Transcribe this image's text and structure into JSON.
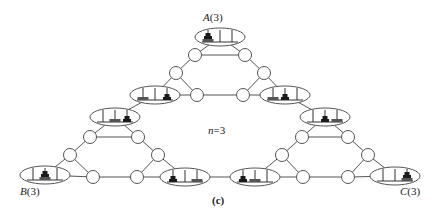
{
  "figure": {
    "caption": "(c)",
    "n_label_var": "n",
    "n_label_rest": "=3",
    "labels": {
      "A": {
        "letter": "A",
        "arg": "(3)"
      },
      "B": {
        "letter": "B",
        "arg": "(3)"
      },
      "C": {
        "letter": "C",
        "arg": "(3)"
      }
    }
  },
  "graph": {
    "stroke": "#555555",
    "disk_dark": "#1a1a1a",
    "disk_gray": "#555555",
    "circles": [
      {
        "x": 195,
        "y": 55
      },
      {
        "x": 245,
        "y": 55
      },
      {
        "x": 176,
        "y": 73
      },
      {
        "x": 264,
        "y": 73
      },
      {
        "x": 197,
        "y": 95
      },
      {
        "x": 243,
        "y": 95
      },
      {
        "x": 90,
        "y": 137
      },
      {
        "x": 138,
        "y": 137
      },
      {
        "x": 70,
        "y": 155
      },
      {
        "x": 158,
        "y": 155
      },
      {
        "x": 93,
        "y": 177
      },
      {
        "x": 137,
        "y": 177
      },
      {
        "x": 302,
        "y": 137
      },
      {
        "x": 348,
        "y": 137
      },
      {
        "x": 282,
        "y": 155
      },
      {
        "x": 368,
        "y": 155
      },
      {
        "x": 303,
        "y": 177
      },
      {
        "x": 348,
        "y": 177
      }
    ],
    "ellipses": [
      {
        "id": "A",
        "x": 220,
        "y": 37,
        "pegs": [
          [
            "L",
            "M",
            "S"
          ],
          [],
          []
        ]
      },
      {
        "id": "ul",
        "x": 155,
        "y": 95,
        "pegs": [
          [
            "L"
          ],
          [],
          [
            "M",
            "S"
          ]
        ]
      },
      {
        "id": "ur",
        "x": 285,
        "y": 95,
        "pegs": [
          [
            "L"
          ],
          [
            "M",
            "S"
          ],
          []
        ]
      },
      {
        "id": "ml",
        "x": 115,
        "y": 117,
        "pegs": [
          [],
          [
            "L"
          ],
          [
            "M",
            "S"
          ]
        ]
      },
      {
        "id": "mr",
        "x": 325,
        "y": 117,
        "pegs": [
          [],
          [
            "M",
            "S"
          ],
          [
            "L"
          ]
        ]
      },
      {
        "id": "B",
        "x": 45,
        "y": 175,
        "pegs": [
          [],
          [
            "L",
            "M",
            "S"
          ],
          []
        ]
      },
      {
        "id": "bl",
        "x": 185,
        "y": 177,
        "pegs": [
          [
            "M",
            "S"
          ],
          [],
          [
            "L"
          ]
        ]
      },
      {
        "id": "br",
        "x": 255,
        "y": 177,
        "pegs": [
          [
            "M",
            "S"
          ],
          [
            "L"
          ],
          []
        ]
      },
      {
        "id": "C",
        "x": 395,
        "y": 176,
        "pegs": [
          [],
          [],
          [
            "L",
            "M",
            "S"
          ]
        ]
      }
    ],
    "edges": [
      [
        "A",
        0
      ],
      [
        "A",
        1
      ],
      [
        0,
        1
      ],
      [
        0,
        2
      ],
      [
        1,
        3
      ],
      [
        2,
        4
      ],
      [
        3,
        5
      ],
      [
        2,
        "ul"
      ],
      [
        4,
        "ul"
      ],
      [
        3,
        "ur"
      ],
      [
        5,
        "ur"
      ],
      [
        4,
        5
      ],
      [
        "ul",
        "ml"
      ],
      [
        "ur",
        "mr"
      ],
      [
        "ml",
        6
      ],
      [
        "ml",
        7
      ],
      [
        6,
        7
      ],
      [
        6,
        8
      ],
      [
        7,
        9
      ],
      [
        8,
        "B"
      ],
      [
        8,
        10
      ],
      [
        9,
        11
      ],
      [
        9,
        "bl"
      ],
      [
        11,
        "bl"
      ],
      [
        10,
        11
      ],
      [
        10,
        "B"
      ],
      [
        "mr",
        12
      ],
      [
        "mr",
        13
      ],
      [
        12,
        13
      ],
      [
        12,
        14
      ],
      [
        13,
        15
      ],
      [
        14,
        "br"
      ],
      [
        14,
        16
      ],
      [
        16,
        "br"
      ],
      [
        15,
        17
      ],
      [
        15,
        "C"
      ],
      [
        17,
        "C"
      ],
      [
        16,
        17
      ],
      [
        "bl",
        "br"
      ]
    ]
  }
}
